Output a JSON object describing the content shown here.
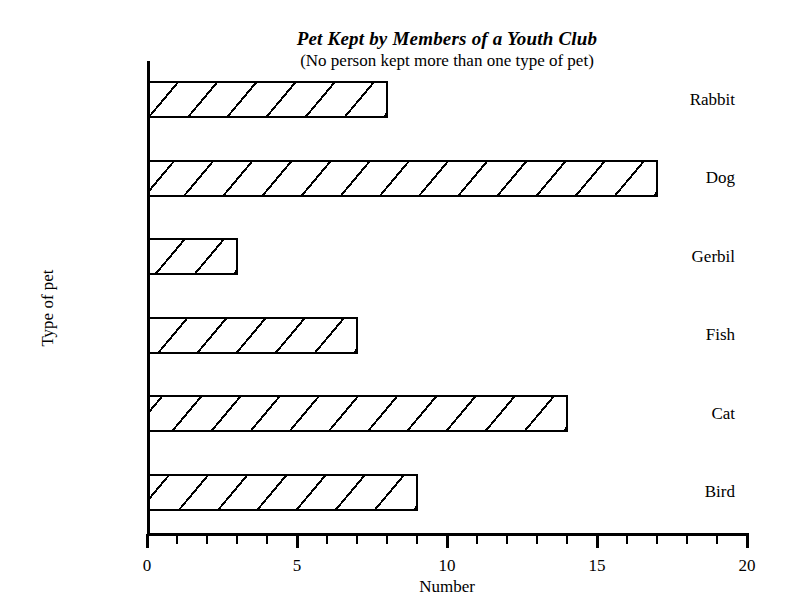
{
  "chart_data": {
    "type": "bar",
    "orientation": "horizontal",
    "title": "Pet Kept by Members of a Youth Club",
    "subtitle": "(No person kept more than one type of pet)",
    "xlabel": "Number",
    "ylabel": "Type of pet",
    "categories": [
      "Bird",
      "Cat",
      "Fish",
      "Gerbil",
      "Dog",
      "Rabbit"
    ],
    "values": [
      9,
      14,
      7,
      3,
      17,
      8
    ],
    "bars": [
      {
        "label": "Rabbit",
        "value": 8
      },
      {
        "label": "Dog",
        "value": 17
      },
      {
        "label": "Gerbil",
        "value": 3
      },
      {
        "label": "Fish",
        "value": 7
      },
      {
        "label": "Cat",
        "value": 14
      },
      {
        "label": "Bird",
        "value": 9
      }
    ],
    "xlim": [
      0,
      20
    ],
    "xtick_labels": [
      "0",
      "5",
      "10",
      "15",
      "20"
    ],
    "xtick_values": [
      0,
      5,
      10,
      15,
      20
    ],
    "x_minor_tick_step": 1,
    "grid": false,
    "legend": false,
    "bar_fill": "diagonal-hatch",
    "colors": {
      "line": "#000000",
      "background": "#ffffff",
      "bar_fill": "#ffffff",
      "hatch": "#000000"
    }
  }
}
